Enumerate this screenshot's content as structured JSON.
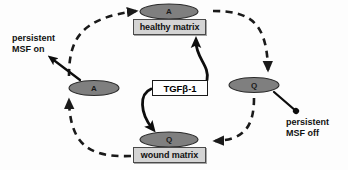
{
  "figure": {
    "type": "state-cycle-diagram",
    "background_color": "#fdfdfd",
    "node_fill_color": "#7f7f7f",
    "matrix_box_fill": "#d4d4d4",
    "signal_box_fill": "#ffffff",
    "stroke_color": "#1a1a1a"
  },
  "nodes": {
    "top": {
      "state": "A",
      "box_label": "healthy matrix"
    },
    "left": {
      "state": "A"
    },
    "right": {
      "state": "Q"
    },
    "bottom": {
      "state": "Q",
      "box_label": "wound matrix"
    }
  },
  "signal": {
    "label": "TGFβ-1"
  },
  "annotations": {
    "msf_on": "persistent\nMSF on",
    "msf_off": "persistent\nMSF off"
  },
  "edges": [
    {
      "from": "left",
      "to": "top",
      "style": "dashed",
      "direction": "right-up"
    },
    {
      "from": "top",
      "to": "right",
      "style": "dashed",
      "direction": "right-down"
    },
    {
      "from": "right",
      "to": "bottom",
      "style": "dashed",
      "direction": "down-left"
    },
    {
      "from": "bottom",
      "to": "left",
      "style": "dashed",
      "direction": "left-up"
    },
    {
      "from": "signal",
      "to": "top",
      "style": "solid",
      "direction": "up"
    },
    {
      "from": "signal",
      "to": "bottom",
      "style": "solid",
      "direction": "down"
    },
    {
      "from": "left",
      "to": "msf_on",
      "style": "solid",
      "direction": "up-left"
    },
    {
      "from": "right",
      "to": "msf_off",
      "style": "solid-dot",
      "direction": "down-right"
    }
  ]
}
